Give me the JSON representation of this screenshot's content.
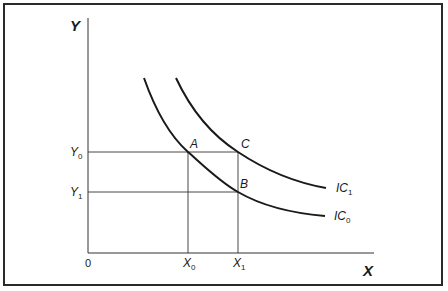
{
  "diagram": {
    "type": "indifference-curves",
    "axes": {
      "x_label": "X",
      "y_label": "Y",
      "origin_label": "0"
    },
    "x_ticks": [
      {
        "main": "X",
        "sub": "0"
      },
      {
        "main": "X",
        "sub": "1"
      }
    ],
    "y_ticks": [
      {
        "main": "Y",
        "sub": "0"
      },
      {
        "main": "Y",
        "sub": "1"
      }
    ],
    "points": [
      {
        "label": "A"
      },
      {
        "label": "B"
      },
      {
        "label": "C"
      }
    ],
    "curves": [
      {
        "main": "IC",
        "sub": "1"
      },
      {
        "main": "IC",
        "sub": "0"
      }
    ],
    "colors": {
      "line": "#1a1a1a",
      "guide": "#333333",
      "border": "#2a2a2a",
      "background": "#ffffff"
    }
  }
}
